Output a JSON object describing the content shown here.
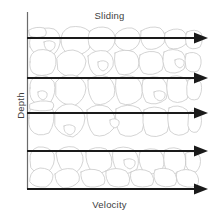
{
  "figure": {
    "type": "diagram",
    "labels": {
      "top": "Sliding",
      "bottom": "Velocity",
      "left": "Depth"
    },
    "colors": {
      "arrow": "#1a1a1a",
      "axis": "#6b6b6b",
      "grain_stroke": "#c9c9c9",
      "grain_fill": "#ffffff",
      "text": "#3d3d3d",
      "background": "#ffffff"
    },
    "axes": {
      "vertical_axis_x": 27,
      "vertical_axis_top": 12,
      "vertical_axis_bottom": 189,
      "horizontal_axis_y": 189,
      "plot_right": 208
    },
    "arrows": [
      {
        "name": "velocity-arrow-1",
        "y": 38,
        "x_start": 27,
        "x_tip": 208,
        "relative_length": 1.0
      },
      {
        "name": "velocity-arrow-2",
        "y": 78,
        "x_start": 27,
        "x_tip": 208,
        "relative_length": 1.0
      },
      {
        "name": "velocity-arrow-3",
        "y": 113,
        "x_start": 27,
        "x_tip": 208,
        "relative_length": 1.0
      },
      {
        "name": "velocity-arrow-4",
        "y": 151,
        "x_start": 27,
        "x_tip": 208,
        "relative_length": 1.0
      },
      {
        "name": "velocity-arrow-5",
        "y": 189,
        "x_start": 27,
        "x_tip": 208,
        "relative_length": 1.0
      }
    ],
    "grain_field": {
      "x_min": 28,
      "x_max": 203,
      "y_min": 27,
      "y_max": 189,
      "description": "packed irregular rounded grains drawn as light grey outlines"
    }
  }
}
